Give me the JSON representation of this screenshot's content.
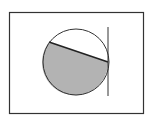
{
  "diagram": {
    "frame": {
      "x": 9,
      "y": 12,
      "width": 135,
      "height": 102,
      "stroke": "#333333"
    },
    "circle": {
      "cx": 76,
      "cy": 62,
      "r": 33,
      "stroke": "#333333"
    },
    "chord": {
      "x1": 49,
      "y1": 42,
      "x2": 108,
      "y2": 62,
      "stroke": "#222222"
    },
    "shaded_segment": {
      "fill": "#b3b3b3"
    },
    "tangent_line": {
      "x": 108,
      "y1": 27,
      "y2": 96,
      "stroke": "#333333"
    }
  }
}
